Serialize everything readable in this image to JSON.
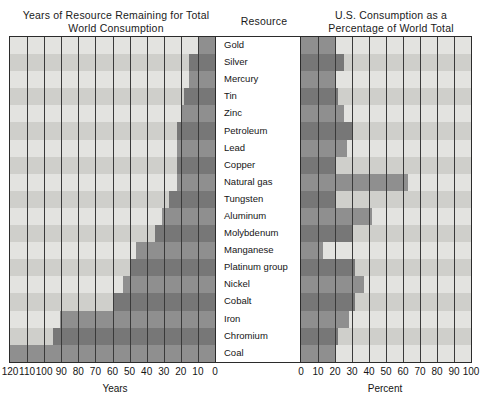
{
  "titles": {
    "left": "Years of Resource Remaining for Total World Consumption",
    "middle": "Resource",
    "right": "U.S. Consumption as a Percentage of World Total"
  },
  "axes": {
    "left": {
      "label": "Years",
      "ticks": [
        "120",
        "110",
        "100",
        "90",
        "80",
        "70",
        "60",
        "50",
        "40",
        "30",
        "20",
        "10",
        "0"
      ],
      "min": 0,
      "max": 120,
      "reversed": true
    },
    "right": {
      "label": "Percent",
      "ticks": [
        "0",
        "10",
        "20",
        "30",
        "40",
        "50",
        "60",
        "70",
        "80",
        "90",
        "100"
      ],
      "min": 0,
      "max": 100,
      "reversed": false
    }
  },
  "colors": {
    "panel_background": "#e3e3e0",
    "row_alt_background": "#cfcfcb",
    "bar": "#8f8f8f",
    "bar_alt": "#777777",
    "frame": "#2b2b2b",
    "gridline": "#3a3a3a",
    "text": "#151515"
  },
  "chart_data": {
    "type": "bar",
    "orientation": "horizontal",
    "categories": [
      "Gold",
      "Silver",
      "Mercury",
      "Tin",
      "Zinc",
      "Petroleum",
      "Lead",
      "Copper",
      "Natural gas",
      "Tungsten",
      "Aluminum",
      "Molybdenum",
      "Manganese",
      "Platinum group",
      "Nickel",
      "Cobalt",
      "Iron",
      "Chromium",
      "Coal"
    ],
    "xlabel": "Years / Percent",
    "ylabel": "Resource",
    "grid": true,
    "legend": "none",
    "series": [
      {
        "name": "Years of Resource Remaining for Total World Consumption",
        "axis": "left",
        "units": "years",
        "xlabel": "Years",
        "xlim": [
          0,
          120
        ],
        "direction": "right-to-left",
        "values": [
          10,
          15,
          15,
          18,
          20,
          22,
          22,
          22,
          22,
          27,
          31,
          35,
          46,
          50,
          54,
          60,
          91,
          95,
          120
        ]
      },
      {
        "name": "U.S. Consumption as a Percentage of World Total",
        "axis": "right",
        "units": "percent",
        "xlabel": "Percent",
        "xlim": [
          0,
          100
        ],
        "direction": "left-to-right",
        "values": [
          20,
          25,
          20,
          22,
          25,
          30,
          27,
          20,
          63,
          20,
          42,
          30,
          13,
          32,
          37,
          32,
          28,
          22,
          20
        ]
      }
    ]
  }
}
